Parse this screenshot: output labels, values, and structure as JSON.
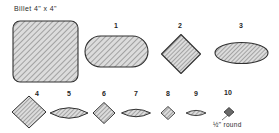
{
  "figure": {
    "title_label": "Billet  4\" x 4\"",
    "caption_label": "½\" round",
    "stroke_color": "#303030",
    "hatch_color": "#6e6e6e",
    "fill_color": "#d8d8d8",
    "background": "#ffffff"
  },
  "shapes": [
    {
      "id": "billet",
      "name": "billet-square",
      "label": "Billet  4\" x 4\"",
      "form": "rounded-square",
      "cx": 45.5,
      "cy": 51.5,
      "w": 65,
      "h": 61,
      "label_x": 14,
      "label_y": 9
    },
    {
      "id": "pass-1",
      "name": "pass-1-oval",
      "label": "1",
      "form": "stadium",
      "cx": 116.5,
      "cy": 51.5,
      "w": 63,
      "h": 31,
      "label_x": 114,
      "label_y": 25
    },
    {
      "id": "pass-2",
      "name": "pass-2-diamond",
      "label": "2",
      "form": "diamond",
      "cx": 181,
      "cy": 54,
      "w": 39,
      "h": 39,
      "label_x": 178,
      "label_y": 25
    },
    {
      "id": "pass-3",
      "name": "pass-3-oval",
      "label": "3",
      "form": "ellipse",
      "cx": 241.5,
      "cy": 53,
      "w": 53,
      "h": 21,
      "label_x": 239,
      "label_y": 25
    },
    {
      "id": "pass-4",
      "name": "pass-4-diamond",
      "label": "4",
      "form": "diamond",
      "cx": 29,
      "cy": 112,
      "w": 34,
      "h": 32,
      "label_x": 35,
      "label_y": 92
    },
    {
      "id": "pass-5",
      "name": "pass-5-oval",
      "label": "5",
      "form": "lens",
      "cx": 69,
      "cy": 113,
      "w": 38,
      "h": 19,
      "label_x": 67,
      "label_y": 92
    },
    {
      "id": "pass-6",
      "name": "pass-6-diamond",
      "label": "6",
      "form": "diamond",
      "cx": 104,
      "cy": 113,
      "w": 22,
      "h": 21,
      "label_x": 102,
      "label_y": 92
    },
    {
      "id": "pass-7",
      "name": "pass-7-oval",
      "label": "7",
      "form": "lens",
      "cx": 136,
      "cy": 113,
      "w": 29,
      "h": 14,
      "label_x": 134,
      "label_y": 92
    },
    {
      "id": "pass-8",
      "name": "pass-8-diamond",
      "label": "8",
      "form": "diamond",
      "cx": 168,
      "cy": 113,
      "w": 14,
      "h": 13,
      "label_x": 166,
      "label_y": 92
    },
    {
      "id": "pass-9",
      "name": "pass-9-oval",
      "label": "9",
      "form": "lens",
      "cx": 196,
      "cy": 113,
      "w": 20,
      "h": 10,
      "label_x": 194,
      "label_y": 92
    },
    {
      "id": "pass-10",
      "name": "pass-10-diamond",
      "label": "10",
      "form": "diamond",
      "cx": 229,
      "cy": 112,
      "w": 10,
      "h": 9,
      "label_x": 224,
      "label_y": 91
    }
  ],
  "caption": {
    "fraction_numerator": "1",
    "fraction_denominator": "2",
    "inch_mark": "\"",
    "text": "round",
    "x": 213,
    "y": 120
  }
}
